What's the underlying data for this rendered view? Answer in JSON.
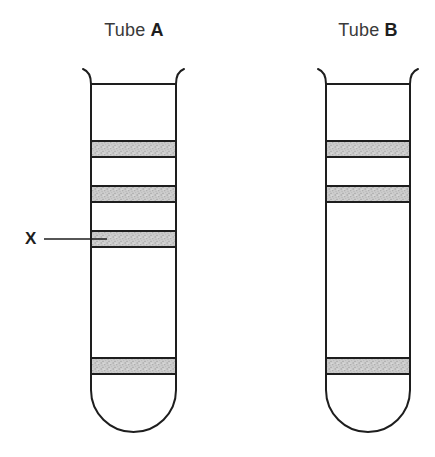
{
  "labels": {
    "tube_a": {
      "prefix": "Tube ",
      "letter": "A"
    },
    "tube_b": {
      "prefix": "Tube ",
      "letter": "B"
    }
  },
  "annotation": {
    "text": "X"
  },
  "colors": {
    "line": "#1e1e1e",
    "text": "#3a3a3a",
    "text_bold": "#1e1e1e",
    "background": "#ffffff",
    "band_base": "#cdcdcd",
    "band_speckle_dark": "#9e9e9e",
    "band_speckle_mid": "#b6b6b6",
    "band_speckle_light": "#e7e7e7"
  },
  "diagram": {
    "width": 435,
    "height": 457,
    "tubes": [
      {
        "id": "tube-a",
        "left": 91,
        "right": 176,
        "rim_tip_y": 69,
        "rim_flare_out": 8,
        "mouth_y": 84,
        "wall_bottom_y": 390,
        "bottom_y": 432,
        "bands": [
          {
            "top": 140,
            "bottom": 158
          },
          {
            "top": 185,
            "bottom": 203
          },
          {
            "top": 230,
            "bottom": 248,
            "label": "X"
          },
          {
            "top": 357,
            "bottom": 375
          }
        ]
      },
      {
        "id": "tube-b",
        "left": 326,
        "right": 410,
        "rim_tip_y": 69,
        "rim_flare_out": 8,
        "mouth_y": 84,
        "wall_bottom_y": 390,
        "bottom_y": 432,
        "bands": [
          {
            "top": 140,
            "bottom": 158
          },
          {
            "top": 185,
            "bottom": 203
          },
          {
            "top": 357,
            "bottom": 375
          }
        ]
      }
    ],
    "pointer": {
      "x1": 44,
      "x2": 107,
      "y": 239
    }
  }
}
